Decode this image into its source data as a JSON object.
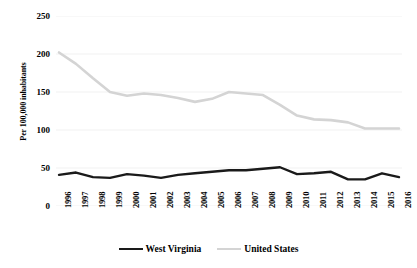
{
  "chart_data": {
    "type": "line",
    "title": "",
    "xlabel": "",
    "ylabel": "Per 100,000 inhabitants",
    "ylim": [
      0,
      250
    ],
    "yticks": [
      0,
      50,
      100,
      150,
      200,
      250
    ],
    "grid": true,
    "legend_position": "bottom",
    "categories": [
      "1996",
      "1997",
      "1998",
      "1999",
      "2000",
      "2001",
      "2002",
      "2003",
      "2004",
      "2005",
      "2006",
      "2007",
      "2008",
      "2009",
      "2010",
      "2011",
      "2012",
      "2013",
      "2014",
      "2015",
      "2016"
    ],
    "series": [
      {
        "name": "West Virginia",
        "color": "#1a1a1a",
        "values": [
          41,
          44,
          38,
          37,
          42,
          40,
          37,
          41,
          43,
          45,
          47,
          47,
          49,
          51,
          42,
          43,
          45,
          35,
          35,
          43,
          38
        ]
      },
      {
        "name": "United States",
        "color": "#d4d4d4",
        "values": [
          202,
          187,
          168,
          150,
          145,
          148,
          146,
          142,
          137,
          141,
          150,
          148,
          146,
          133,
          119,
          114,
          113,
          110,
          102,
          102,
          102
        ]
      }
    ]
  },
  "axes": {
    "y_tick_labels": [
      "250",
      "200",
      "150",
      "100",
      "50",
      "0"
    ],
    "y_axis_title": "Per 100,000 inhabitants",
    "x_tick_labels": [
      "1996",
      "1997",
      "1998",
      "1999",
      "2000",
      "2001",
      "2002",
      "2003",
      "2004",
      "2005",
      "2006",
      "2007",
      "2008",
      "2009",
      "2010",
      "2011",
      "2012",
      "2013",
      "2014",
      "2015",
      "2016"
    ]
  },
  "legend": {
    "entries": [
      {
        "label": "West Virginia",
        "color": "#1a1a1a"
      },
      {
        "label": "United States",
        "color": "#d4d4d4"
      }
    ]
  },
  "colors": {
    "west_virginia": "#1a1a1a",
    "united_states": "#d4d4d4",
    "gridline": "#efefef",
    "background": "#ffffff"
  }
}
